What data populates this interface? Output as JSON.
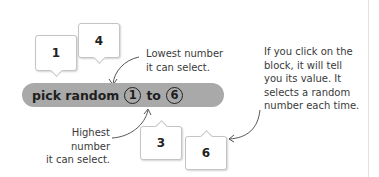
{
  "block": {
    "label": "pick random",
    "from_value": "1",
    "connector": "to",
    "to_value": "6",
    "color": "#a9a9a9"
  },
  "bubbles": [
    {
      "value": "1"
    },
    {
      "value": "4"
    },
    {
      "value": "3"
    },
    {
      "value": "6"
    }
  ],
  "annotations": {
    "lowest": [
      "Lowest number",
      "it can select."
    ],
    "highest": [
      "Highest number",
      "it can select."
    ],
    "click": [
      "If you click on the",
      "block, it will tell",
      "you its value. It",
      "selects a random",
      "number each time."
    ]
  }
}
